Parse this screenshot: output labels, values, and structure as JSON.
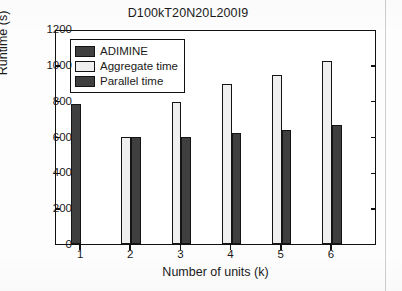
{
  "chart_data": {
    "type": "bar",
    "title": "D100kT20N20L200I9",
    "xlabel": "Number of units (k)",
    "ylabel": "Runtime (s)",
    "categories": [
      "1",
      "2",
      "3",
      "4",
      "5",
      "6"
    ],
    "xlim": [
      0.5,
      6.9
    ],
    "ylim": [
      0,
      1200
    ],
    "yticks": [
      0,
      200,
      400,
      600,
      800,
      1000,
      1200
    ],
    "ytick_labels": [
      "0",
      "200",
      "400",
      "600",
      "800",
      "1000",
      "1200"
    ],
    "grid": false,
    "legend_position": "upper left",
    "series": [
      {
        "name": "ADIMINE",
        "color": "#3f3f3f",
        "values": [
          780,
          null,
          null,
          null,
          null,
          null
        ]
      },
      {
        "name": "Aggregate time",
        "color": "#efefef",
        "values": [
          null,
          595,
          790,
          895,
          945,
          1020
        ]
      },
      {
        "name": "Parallel time",
        "color": "#3f3f3f",
        "values": [
          null,
          595,
          600,
          620,
          635,
          665
        ]
      }
    ]
  },
  "colors": {
    "dark_series": "#3f3f3f",
    "light_series": "#efefef",
    "axis": "#111111",
    "text": "#1a1a1a",
    "background": "#ffffff"
  }
}
